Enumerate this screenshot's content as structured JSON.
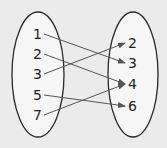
{
  "diagram": {
    "type": "mapping",
    "colors": {
      "background": "#ebebeb",
      "ellipse_fill": "#f6f6f6",
      "ellipse_stroke": "#2a2a2a",
      "text": "#1e1e1e",
      "arrow": "#555555"
    },
    "domain": {
      "label": "domain-set",
      "ellipse": {
        "cx": 38,
        "cy": 74.5,
        "rx": 26,
        "ry": 62.5
      },
      "values": [
        {
          "label": "1",
          "x": 38,
          "y": 34
        },
        {
          "label": "2",
          "x": 38,
          "y": 54
        },
        {
          "label": "3",
          "x": 38,
          "y": 74
        },
        {
          "label": "5",
          "x": 38,
          "y": 95
        },
        {
          "label": "7",
          "x": 38,
          "y": 115
        }
      ]
    },
    "range": {
      "label": "range-set",
      "ellipse": {
        "cx": 133,
        "cy": 74.5,
        "rx": 25,
        "ry": 62.5
      },
      "values": [
        {
          "label": "2",
          "x": 133,
          "y": 43
        },
        {
          "label": "3",
          "x": 133,
          "y": 63
        },
        {
          "label": "4",
          "x": 133,
          "y": 84
        },
        {
          "label": "6",
          "x": 133,
          "y": 106
        }
      ]
    },
    "mappings": [
      {
        "from": "1",
        "to": "3"
      },
      {
        "from": "2",
        "to": "4"
      },
      {
        "from": "3",
        "to": "2"
      },
      {
        "from": "5",
        "to": "6"
      },
      {
        "from": "7",
        "to": "4"
      }
    ]
  }
}
